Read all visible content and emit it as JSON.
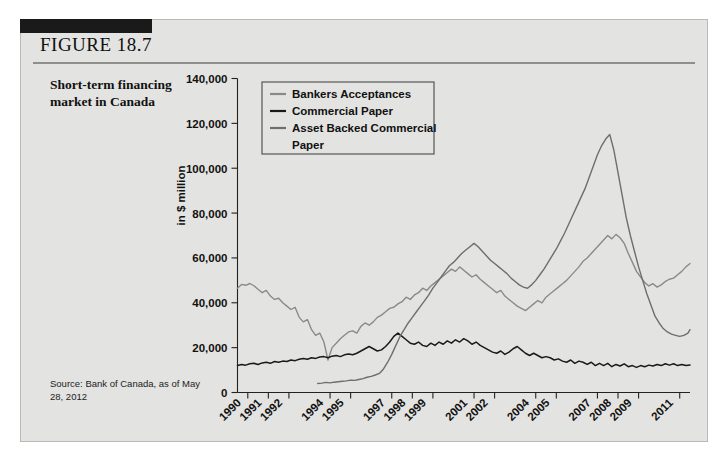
{
  "figure": {
    "label": "FIGURE 18.7",
    "caption": "Short-term financing market in Canada",
    "source": "Source: Bank of Canada, as of May 28, 2012"
  },
  "colors": {
    "background": "#e3e3e1",
    "page": "#ffffff",
    "tab": "#1a1a1a",
    "rule": "#8e8e8c",
    "bankers_acceptances": "#8a8a88",
    "commercial_paper": "#1a1a1a",
    "asset_backed_commercial_paper": "#6e6e6c"
  },
  "chart_data": {
    "type": "line",
    "title": "Short-term financing market in Canada",
    "xlabel": "",
    "ylabel": "in $ million",
    "ylim": [
      0,
      140000
    ],
    "ytick_labels": [
      "0",
      "20,000",
      "40,000",
      "60,000",
      "80,000",
      "100,000",
      "120,000",
      "140,000"
    ],
    "ytick_values": [
      0,
      20000,
      40000,
      60000,
      80000,
      100000,
      120000,
      140000
    ],
    "xlim": [
      1990,
      2012
    ],
    "xtick_labels": [
      "1990",
      "1991",
      "1992",
      "1994",
      "1995",
      "1997",
      "1998",
      "1999",
      "2001",
      "2002",
      "2004",
      "2005",
      "2007",
      "2008",
      "2009",
      "2011"
    ],
    "xtick_values": [
      1990,
      1991,
      1992,
      1994,
      1995,
      1997,
      1998,
      1999,
      2001,
      2002,
      2004,
      2005,
      2007,
      2008,
      2009,
      2011
    ],
    "grid": false,
    "legend_position": "top-left-inside",
    "legend": [
      "Bankers Acceptances",
      "Commercial Paper",
      "Asset Backed Commercial Paper"
    ],
    "series": [
      {
        "name": "Bankers Acceptances",
        "color": "#8a8a88",
        "x": [
          1990.0,
          1990.2,
          1990.4,
          1990.6,
          1990.8,
          1991.0,
          1991.2,
          1991.4,
          1991.6,
          1991.8,
          1992.0,
          1992.2,
          1992.4,
          1992.6,
          1992.8,
          1993.0,
          1993.2,
          1993.4,
          1993.6,
          1993.8,
          1994.0,
          1994.2,
          1994.4,
          1994.6,
          1994.8,
          1995.0,
          1995.2,
          1995.4,
          1995.6,
          1995.8,
          1996.0,
          1996.2,
          1996.4,
          1996.6,
          1996.8,
          1997.0,
          1997.2,
          1997.4,
          1997.6,
          1997.8,
          1998.0,
          1998.2,
          1998.4,
          1998.6,
          1998.8,
          1999.0,
          1999.2,
          1999.4,
          1999.6,
          1999.8,
          2000.0,
          2000.2,
          2000.4,
          2000.6,
          2000.8,
          2001.0,
          2001.2,
          2001.4,
          2001.6,
          2001.8,
          2002.0,
          2002.2,
          2002.4,
          2002.6,
          2002.8,
          2003.0,
          2003.2,
          2003.4,
          2003.6,
          2003.8,
          2004.0,
          2004.2,
          2004.4,
          2004.6,
          2004.8,
          2005.0,
          2005.2,
          2005.4,
          2005.6,
          2005.8,
          2006.0,
          2006.2,
          2006.4,
          2006.6,
          2006.8,
          2007.0,
          2007.2,
          2007.4,
          2007.6,
          2007.8,
          2008.0,
          2008.2,
          2008.4,
          2008.6,
          2008.8,
          2009.0,
          2009.2,
          2009.4,
          2009.6,
          2009.8,
          2010.0,
          2010.2,
          2010.4,
          2010.6,
          2010.8,
          2011.0,
          2011.2,
          2011.4,
          2011.6,
          2011.8,
          2012.0
        ],
        "y": [
          46500,
          48200,
          47800,
          48600,
          47600,
          46000,
          44500,
          45500,
          43000,
          41500,
          42000,
          40000,
          38500,
          37000,
          38000,
          33500,
          31500,
          32500,
          28000,
          25500,
          26500,
          22500,
          14500,
          20000,
          22000,
          24000,
          25500,
          27000,
          27500,
          26500,
          29500,
          31000,
          30000,
          31500,
          33500,
          34500,
          36000,
          37500,
          38000,
          39500,
          40500,
          42500,
          41500,
          43500,
          44500,
          46500,
          45500,
          47500,
          49000,
          50500,
          52000,
          53500,
          55000,
          54000,
          56000,
          54500,
          53000,
          51500,
          52500,
          50500,
          49000,
          47500,
          46000,
          44500,
          45500,
          43000,
          41500,
          40000,
          38500,
          37500,
          36500,
          38000,
          39500,
          41000,
          40000,
          42500,
          44000,
          45500,
          47000,
          48500,
          50000,
          52000,
          54000,
          56000,
          58500,
          60000,
          62000,
          64000,
          66000,
          68000,
          70000,
          68500,
          70500,
          69000,
          66500,
          62000,
          58000,
          54000,
          51500,
          49000,
          47500,
          48500,
          47000,
          48000,
          49500,
          50500,
          51000,
          52500,
          54000,
          56000,
          57500
        ]
      },
      {
        "name": "Commercial Paper",
        "color": "#1a1a1a",
        "x": [
          1990.0,
          1990.2,
          1990.4,
          1990.6,
          1990.8,
          1991.0,
          1991.2,
          1991.4,
          1991.6,
          1991.8,
          1992.0,
          1992.2,
          1992.4,
          1992.6,
          1992.8,
          1993.0,
          1993.2,
          1993.4,
          1993.6,
          1993.8,
          1994.0,
          1994.2,
          1994.4,
          1994.6,
          1994.8,
          1995.0,
          1995.2,
          1995.4,
          1995.6,
          1995.8,
          1996.0,
          1996.2,
          1996.4,
          1996.6,
          1996.8,
          1997.0,
          1997.2,
          1997.4,
          1997.6,
          1997.8,
          1998.0,
          1998.2,
          1998.4,
          1998.6,
          1998.8,
          1999.0,
          1999.2,
          1999.4,
          1999.6,
          1999.8,
          2000.0,
          2000.2,
          2000.4,
          2000.6,
          2000.8,
          2001.0,
          2001.2,
          2001.4,
          2001.6,
          2001.8,
          2002.0,
          2002.2,
          2002.4,
          2002.6,
          2002.8,
          2003.0,
          2003.2,
          2003.4,
          2003.6,
          2003.8,
          2004.0,
          2004.2,
          2004.4,
          2004.6,
          2004.8,
          2005.0,
          2005.2,
          2005.4,
          2005.6,
          2005.8,
          2006.0,
          2006.2,
          2006.4,
          2006.6,
          2006.8,
          2007.0,
          2007.2,
          2007.4,
          2007.6,
          2007.8,
          2008.0,
          2008.2,
          2008.4,
          2008.6,
          2008.8,
          2009.0,
          2009.2,
          2009.4,
          2009.6,
          2009.8,
          2010.0,
          2010.2,
          2010.4,
          2010.6,
          2010.8,
          2011.0,
          2011.2,
          2011.4,
          2011.6,
          2011.8,
          2012.0
        ],
        "y": [
          12000,
          12500,
          12200,
          12800,
          13000,
          12500,
          13200,
          13500,
          13000,
          13800,
          13500,
          14000,
          13800,
          14500,
          14200,
          14800,
          15200,
          14800,
          15500,
          15200,
          15800,
          16000,
          15500,
          16200,
          16500,
          16000,
          16800,
          17200,
          16800,
          17500,
          18500,
          19500,
          20500,
          19500,
          18500,
          19000,
          20500,
          22500,
          25000,
          26500,
          25000,
          23500,
          22000,
          21500,
          22500,
          21000,
          20500,
          22000,
          21000,
          22500,
          21500,
          23000,
          22000,
          23500,
          22500,
          24000,
          23000,
          21500,
          22500,
          21000,
          20000,
          19000,
          18000,
          17500,
          18500,
          17000,
          18000,
          19500,
          20500,
          19000,
          17500,
          16500,
          17500,
          16500,
          15500,
          16000,
          15500,
          14500,
          15000,
          14000,
          13500,
          14500,
          13000,
          14000,
          13500,
          12500,
          13500,
          12000,
          13000,
          12000,
          13000,
          11500,
          12500,
          11800,
          12800,
          11500,
          12000,
          11200,
          12000,
          11500,
          12200,
          11800,
          12500,
          12000,
          12800,
          12200,
          12800,
          12000,
          12500,
          12000,
          12300
        ]
      },
      {
        "name": "Asset Backed Commercial Paper",
        "color": "#6e6e6c",
        "x": [
          1993.9,
          1994.1,
          1994.3,
          1994.5,
          1994.7,
          1994.9,
          1995.1,
          1995.3,
          1995.5,
          1995.7,
          1995.9,
          1996.1,
          1996.3,
          1996.5,
          1996.7,
          1996.9,
          1997.1,
          1997.3,
          1997.5,
          1997.7,
          1997.9,
          1998.1,
          1998.3,
          1998.5,
          1998.7,
          1998.9,
          1999.1,
          1999.3,
          1999.5,
          1999.7,
          1999.9,
          2000.1,
          2000.3,
          2000.5,
          2000.7,
          2000.9,
          2001.1,
          2001.3,
          2001.5,
          2001.7,
          2001.9,
          2002.1,
          2002.3,
          2002.5,
          2002.7,
          2002.9,
          2003.1,
          2003.3,
          2003.5,
          2003.7,
          2003.9,
          2004.1,
          2004.3,
          2004.5,
          2004.7,
          2004.9,
          2005.1,
          2005.3,
          2005.5,
          2005.7,
          2005.9,
          2006.1,
          2006.3,
          2006.5,
          2006.7,
          2006.9,
          2007.1,
          2007.3,
          2007.5,
          2007.7,
          2007.9,
          2008.1,
          2008.3,
          2008.5,
          2008.7,
          2008.9,
          2009.1,
          2009.3,
          2009.5,
          2009.7,
          2009.9,
          2010.1,
          2010.3,
          2010.5,
          2010.7,
          2010.9,
          2011.1,
          2011.3,
          2011.5,
          2011.7,
          2011.9,
          2012.0
        ],
        "y": [
          4000,
          4200,
          4500,
          4300,
          4600,
          4800,
          5000,
          5200,
          5500,
          5400,
          5800,
          6200,
          6800,
          7200,
          7800,
          8500,
          10500,
          13500,
          17000,
          21000,
          25000,
          28000,
          31000,
          33500,
          36000,
          38500,
          41000,
          43500,
          46500,
          49000,
          51500,
          54000,
          56500,
          58000,
          60000,
          62000,
          63500,
          65000,
          66500,
          65000,
          63000,
          61000,
          59000,
          57500,
          56000,
          54500,
          53000,
          51000,
          49500,
          48000,
          47000,
          46500,
          48000,
          50000,
          52500,
          55000,
          58000,
          61000,
          64000,
          67500,
          71000,
          75000,
          79000,
          83000,
          87000,
          91000,
          96000,
          101000,
          106000,
          110000,
          113000,
          115000,
          108000,
          98000,
          88000,
          78000,
          70000,
          63000,
          56000,
          50000,
          44000,
          39000,
          34000,
          31000,
          28500,
          27000,
          26000,
          25500,
          25000,
          25500,
          26500,
          28000
        ]
      }
    ]
  }
}
